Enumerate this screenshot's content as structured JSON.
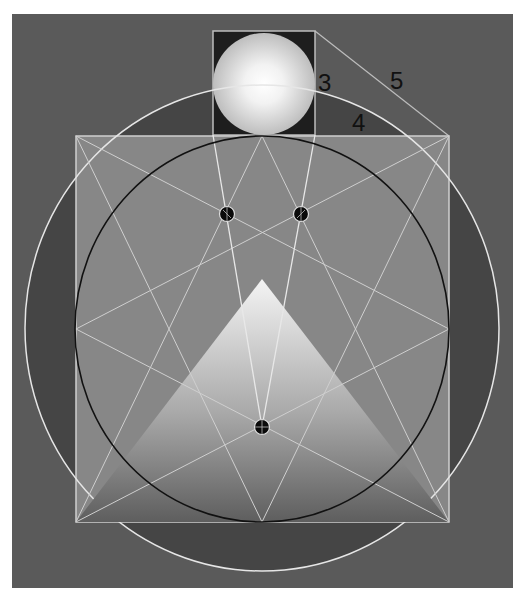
{
  "diagram": {
    "labels": {
      "side_a": "3",
      "side_b": "4",
      "hypotenuse": "5"
    },
    "colors": {
      "background": "#5a5a5a",
      "outer_ring_fill": "#454545",
      "square_fill": "#878787",
      "small_square_fill": "#1e1e1e",
      "line_light": "#d8d8d8",
      "inner_circle_stroke": "#111111",
      "sphere_highlight": "#ffffff",
      "sphere_shadow": "#b9b9b9",
      "triangle_top": "#f2f2f2",
      "triangle_bottom": "#5e5e5e"
    }
  }
}
